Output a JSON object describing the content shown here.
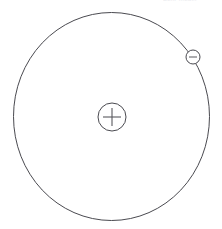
{
  "diagram": {
    "background_color": "#ffffff",
    "stroke_color": "#4a4a50",
    "sign_color": "#59595f",
    "width": 222,
    "height": 229,
    "orbit": {
      "label": "electron-orbit",
      "center_x": 111.5,
      "center_y": 116.5,
      "radius_x": 98,
      "radius_y": 104,
      "stroke_width": 1,
      "fill": "none"
    },
    "nucleus": {
      "label": "nucleus",
      "charge_symbol": "+",
      "center_x": 112,
      "center_y": 117,
      "radius": 14,
      "sign_arm_length": 9
    },
    "electron": {
      "label": "electron",
      "charge_symbol": "−",
      "center_x": 193,
      "center_y": 57,
      "radius": 7,
      "sign_arm_length": 4,
      "orbit_angle_degrees": 35
    },
    "cropped_caption": {
      "label": "cropped-caption-fragment",
      "text": "Bohr model",
      "color": "#e9eaee",
      "legible": false
    }
  }
}
